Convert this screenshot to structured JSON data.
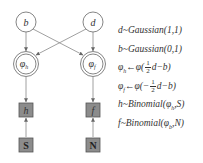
{
  "diagram": {
    "nodes": [
      {
        "id": "b",
        "label": "b",
        "type": "latent-circle"
      },
      {
        "id": "d",
        "label": "d",
        "type": "latent-circle"
      },
      {
        "id": "phi_h",
        "label": "φ",
        "sub": "h",
        "type": "deterministic-double-circle"
      },
      {
        "id": "phi_f",
        "label": "φ",
        "sub": "f",
        "type": "deterministic-double-circle"
      },
      {
        "id": "h",
        "label": "h",
        "type": "observed-box"
      },
      {
        "id": "f",
        "label": "f",
        "type": "observed-box"
      },
      {
        "id": "S",
        "label": "S",
        "type": "observed-box"
      },
      {
        "id": "N",
        "label": "N",
        "type": "observed-box"
      }
    ],
    "edges": [
      [
        "b",
        "phi_h"
      ],
      [
        "b",
        "phi_f"
      ],
      [
        "d",
        "phi_h"
      ],
      [
        "d",
        "phi_f"
      ],
      [
        "phi_h",
        "h"
      ],
      [
        "phi_f",
        "f"
      ],
      [
        "S",
        "h"
      ],
      [
        "N",
        "f"
      ]
    ],
    "colors": {
      "line": "#888888",
      "box_fill": "#8c8c8c",
      "box_border": "#555555",
      "circle_fill": "#ffffff"
    }
  },
  "equations": {
    "eq1": {
      "lhs": "d",
      "rhs": "~Gaussian(1,1)"
    },
    "eq2": {
      "lhs": "b",
      "rhs": "~Gaussian(0,1)"
    },
    "eq3": {
      "lhs": "φ",
      "sub": "h",
      "arrow": "←",
      "fn": "φ(",
      "num": "1",
      "den": "2",
      "tail": "d−b)"
    },
    "eq4": {
      "lhs": "φ",
      "sub": "f",
      "arrow": "←",
      "fn": "φ(−",
      "num": "1",
      "den": "2",
      "tail": "d−b)"
    },
    "eq5": {
      "text_a": "h~Binomial(",
      "phi": "φ",
      "sub": "h",
      "text_b": ",S)"
    },
    "eq6": {
      "text_a": "f~Binomial(",
      "phi": "φ",
      "sub": "b",
      "text_b": ",N)"
    }
  }
}
